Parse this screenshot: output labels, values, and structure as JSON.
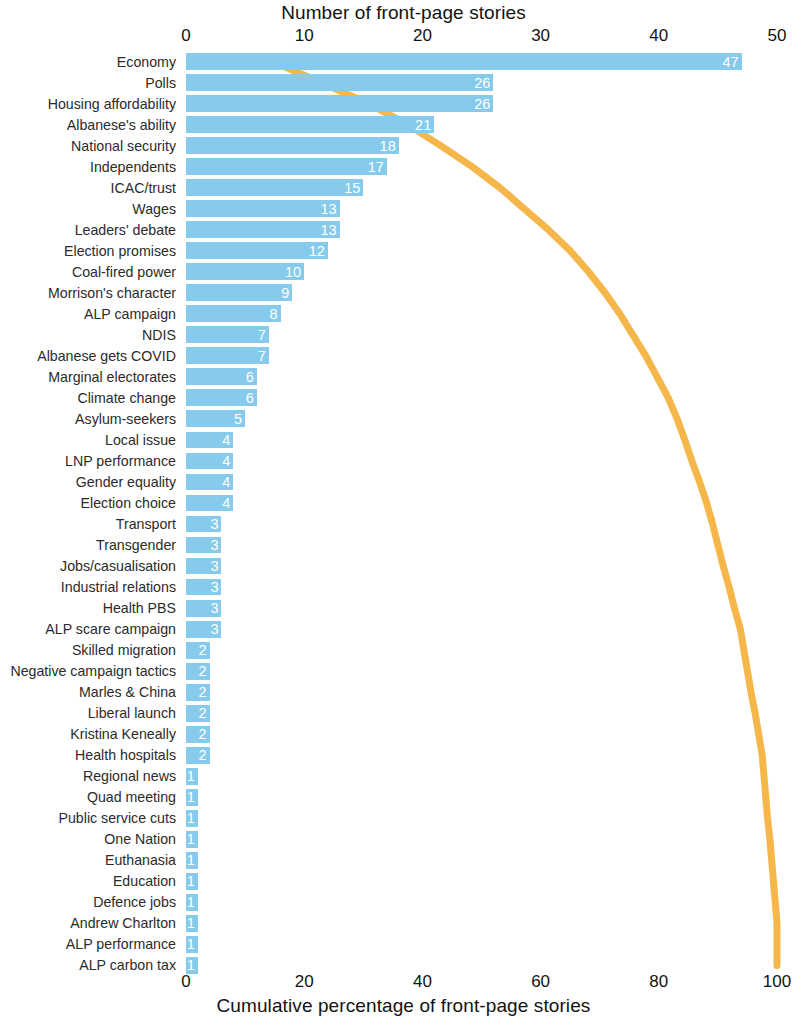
{
  "chart_data": {
    "type": "bar",
    "title": "",
    "top_axis_label": "Number of front-page stories",
    "bottom_axis_label": "Cumulative percentage of front-page stories",
    "xlabel": "Number of front-page stories",
    "ylabel": "",
    "orientation": "horizontal",
    "grid": false,
    "legend": "none",
    "bar_color": "#86cbec",
    "line_color": "#f5b64a",
    "value_label_color": "#ffffff",
    "xlim": [
      0,
      50
    ],
    "cumulative_xlim": [
      0,
      100
    ],
    "top_ticks": [
      0,
      10,
      20,
      30,
      40,
      50
    ],
    "bottom_ticks": [
      0,
      20,
      40,
      60,
      80,
      100
    ],
    "total": 320,
    "categories": [
      "Economy",
      "Polls",
      "Housing affordability",
      "Albanese's ability",
      "National security",
      "Independents",
      "ICAC/trust",
      "Wages",
      "Leaders' debate",
      "Election promises",
      "Coal-fired power",
      "Morrison's character",
      "ALP campaign",
      "NDIS",
      "Albanese gets COVID",
      "Marginal electorates",
      "Climate change",
      "Asylum-seekers",
      "Local issue",
      "LNP performance",
      "Gender equality",
      "Election choice",
      "Transport",
      "Transgender",
      "Jobs/casualisation",
      "Industrial relations",
      "Health PBS",
      "ALP scare campaign",
      "Skilled migration",
      "Negative campaign tactics",
      "Marles & China",
      "Liberal launch",
      "Kristina Keneally",
      "Health hospitals",
      "Regional news",
      "Quad meeting",
      "Public service cuts",
      "One Nation",
      "Euthanasia",
      "Education",
      "Defence jobs",
      "Andrew Charlton",
      "ALP performance",
      "ALP carbon tax"
    ],
    "values": [
      47,
      26,
      26,
      21,
      18,
      17,
      15,
      13,
      13,
      12,
      10,
      9,
      8,
      7,
      7,
      6,
      6,
      5,
      4,
      4,
      4,
      4,
      3,
      3,
      3,
      3,
      3,
      3,
      2,
      2,
      2,
      2,
      2,
      2,
      1,
      1,
      1,
      1,
      1,
      1,
      1,
      1,
      1,
      1
    ],
    "series": [
      {
        "name": "Number of front-page stories",
        "type": "bar",
        "values": [
          47,
          26,
          26,
          21,
          18,
          17,
          15,
          13,
          13,
          12,
          10,
          9,
          8,
          7,
          7,
          6,
          6,
          5,
          4,
          4,
          4,
          4,
          3,
          3,
          3,
          3,
          3,
          3,
          2,
          2,
          2,
          2,
          2,
          2,
          1,
          1,
          1,
          1,
          1,
          1,
          1,
          1,
          1,
          1
        ]
      },
      {
        "name": "Cumulative percentage of front-page stories",
        "type": "line",
        "values": [
          14.7,
          22.8,
          30.9,
          37.5,
          43.1,
          48.4,
          53.1,
          57.2,
          61.3,
          65.0,
          68.1,
          70.9,
          73.4,
          75.6,
          77.8,
          79.7,
          81.6,
          83.1,
          84.4,
          85.6,
          86.9,
          88.1,
          89.1,
          90.0,
          90.9,
          91.9,
          92.8,
          93.8,
          94.4,
          95.0,
          95.6,
          96.3,
          96.9,
          97.5,
          97.8,
          98.1,
          98.4,
          98.8,
          99.1,
          99.4,
          99.7,
          100.0,
          100.0,
          100.0
        ]
      }
    ]
  }
}
